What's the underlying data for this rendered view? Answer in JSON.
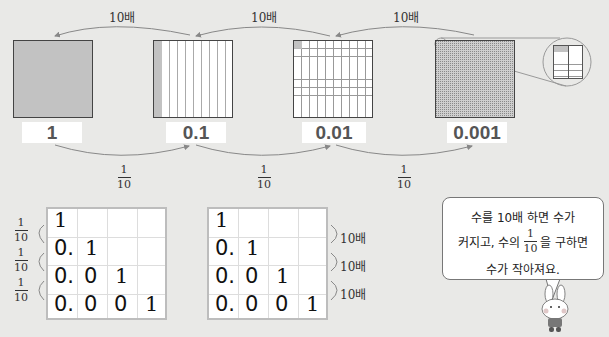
{
  "top_arrows": {
    "times_label": "10배",
    "labels": [
      "10배",
      "10배",
      "10배"
    ]
  },
  "squares": [
    {
      "value": "1",
      "fill": "full"
    },
    {
      "value": "0.1",
      "fill": "one-tenth"
    },
    {
      "value": "0.01",
      "fill": "one-hundredth"
    },
    {
      "value": "0.001",
      "fill": "one-thousandth"
    }
  ],
  "bottom_arrows": {
    "labels": [
      {
        "numerator": "1",
        "denominator": "10"
      },
      {
        "numerator": "1",
        "denominator": "10"
      },
      {
        "numerator": "1",
        "denominator": "10"
      }
    ]
  },
  "left_table": {
    "side_labels": [
      {
        "numerator": "1",
        "denominator": "10"
      },
      {
        "numerator": "1",
        "denominator": "10"
      },
      {
        "numerator": "1",
        "denominator": "10"
      }
    ],
    "rows": [
      [
        "1",
        "",
        "",
        ""
      ],
      [
        "0.",
        "1",
        "",
        ""
      ],
      [
        "0.",
        "0",
        "1",
        ""
      ],
      [
        "0.",
        "0",
        "0",
        "1"
      ]
    ]
  },
  "right_table": {
    "side_labels": [
      "10배",
      "10배",
      "10배"
    ],
    "rows": [
      [
        "1",
        "",
        "",
        ""
      ],
      [
        "0.",
        "1",
        "",
        ""
      ],
      [
        "0.",
        "0",
        "1",
        ""
      ],
      [
        "0.",
        "0",
        "0",
        "1"
      ]
    ]
  },
  "speech_bubble": {
    "line1": "수를 10배 하면 수가",
    "line2_pre": "커지고, 수의",
    "frac_num": "1",
    "frac_den": "10",
    "line2_post": "을 구하면",
    "line3": "수가 작아져요."
  },
  "colors": {
    "background": "#e9e9e7",
    "shade": "#c2c2c2",
    "arrow": "#999999"
  }
}
